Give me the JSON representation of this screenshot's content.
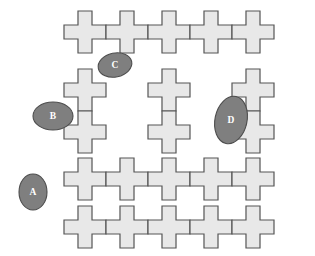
{
  "diagram": {
    "canvas": {
      "width": 315,
      "height": 256
    },
    "colors": {
      "background": "#ffffff",
      "tile_fill": "#e8e8e8",
      "tile_stroke": "#555555",
      "marker_fill": "#7f7f7f",
      "marker_stroke": "#4d4d4d",
      "marker_text": "#ffffff"
    },
    "tile": {
      "shape": "cross",
      "period": 42,
      "size": 42,
      "arm_ratio": 0.333
    },
    "tiles": [
      {
        "id": "t-r0-c0",
        "col": 0,
        "row": 0,
        "x": 64,
        "y": 11
      },
      {
        "id": "t-r0-c1",
        "col": 1,
        "row": 0,
        "x": 106,
        "y": 11
      },
      {
        "id": "t-r0-c2",
        "col": 2,
        "row": 0,
        "x": 148,
        "y": 11
      },
      {
        "id": "t-r0-c3",
        "col": 3,
        "row": 0,
        "x": 190,
        "y": 11
      },
      {
        "id": "t-r0-c4",
        "col": 4,
        "row": 0,
        "x": 232,
        "y": 11
      },
      {
        "id": "t-r1-c0",
        "col": 0,
        "row": 1,
        "x": 64,
        "y": 69
      },
      {
        "id": "t-r1-c2",
        "col": 2,
        "row": 1,
        "x": 148,
        "y": 69
      },
      {
        "id": "t-r1-c4",
        "col": 4,
        "row": 1,
        "x": 232,
        "y": 69
      },
      {
        "id": "t-r2-c0",
        "col": 0,
        "row": 2,
        "x": 64,
        "y": 111
      },
      {
        "id": "t-r2-c2",
        "col": 2,
        "row": 2,
        "x": 148,
        "y": 111
      },
      {
        "id": "t-r2-c4",
        "col": 4,
        "row": 2,
        "x": 232,
        "y": 111
      },
      {
        "id": "t-r3-c0",
        "col": 0,
        "row": 3,
        "x": 64,
        "y": 158
      },
      {
        "id": "t-r3-c1",
        "col": 1,
        "row": 3,
        "x": 106,
        "y": 158
      },
      {
        "id": "t-r3-c2",
        "col": 2,
        "row": 3,
        "x": 148,
        "y": 158
      },
      {
        "id": "t-r3-c3",
        "col": 3,
        "row": 3,
        "x": 190,
        "y": 158
      },
      {
        "id": "t-r3-c4",
        "col": 4,
        "row": 3,
        "x": 232,
        "y": 158
      },
      {
        "id": "t-r4-c0",
        "col": 0,
        "row": 4,
        "x": 64,
        "y": 206
      },
      {
        "id": "t-r4-c1",
        "col": 1,
        "row": 4,
        "x": 106,
        "y": 206
      },
      {
        "id": "t-r4-c2",
        "col": 2,
        "row": 4,
        "x": 148,
        "y": 206
      },
      {
        "id": "t-r4-c3",
        "col": 3,
        "row": 4,
        "x": 190,
        "y": 206
      },
      {
        "id": "t-r4-c4",
        "col": 4,
        "row": 4,
        "x": 232,
        "y": 206
      }
    ],
    "markers": [
      {
        "id": "marker-a",
        "label": "A",
        "cx": 33,
        "cy": 192,
        "rx": 14,
        "ry": 18,
        "rotate": 0
      },
      {
        "id": "marker-b",
        "label": "B",
        "cx": 53,
        "cy": 116,
        "rx": 20,
        "ry": 14,
        "rotate": 0
      },
      {
        "id": "marker-c",
        "label": "C",
        "cx": 115,
        "cy": 65,
        "rx": 17,
        "ry": 12,
        "rotate": -12
      },
      {
        "id": "marker-d",
        "label": "D",
        "cx": 231,
        "cy": 120,
        "rx": 16,
        "ry": 24,
        "rotate": 12
      }
    ]
  }
}
